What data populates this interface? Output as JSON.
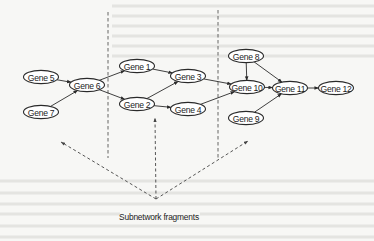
{
  "diagram": {
    "type": "gene-regulatory-network",
    "nodes": [
      {
        "id": "g5",
        "label": "Gene 5",
        "cx": 41,
        "cy": 77
      },
      {
        "id": "g7",
        "label": "Gene 7",
        "cx": 41,
        "cy": 112
      },
      {
        "id": "g6",
        "label": "Gene 6",
        "cx": 87,
        "cy": 85
      },
      {
        "id": "g1",
        "label": "Gene 1",
        "cx": 137,
        "cy": 66
      },
      {
        "id": "g2",
        "label": "Gene 2",
        "cx": 137,
        "cy": 104
      },
      {
        "id": "g3",
        "label": "Gene 3",
        "cx": 188,
        "cy": 76
      },
      {
        "id": "g4",
        "label": "Gene 4",
        "cx": 188,
        "cy": 109
      },
      {
        "id": "g8",
        "label": "Gene 8",
        "cx": 246,
        "cy": 56
      },
      {
        "id": "g10",
        "label": "Gene 10",
        "cx": 247,
        "cy": 87
      },
      {
        "id": "g9",
        "label": "Gene 9",
        "cx": 246,
        "cy": 118
      },
      {
        "id": "g11",
        "label": "Gene 11",
        "cx": 290,
        "cy": 88
      },
      {
        "id": "g12",
        "label": "Gene 12",
        "cx": 336,
        "cy": 88
      }
    ],
    "edges": [
      {
        "from": "g5",
        "to": "g6"
      },
      {
        "from": "g7",
        "to": "g6"
      },
      {
        "from": "g6",
        "to": "g1"
      },
      {
        "from": "g6",
        "to": "g2"
      },
      {
        "from": "g1",
        "to": "g3"
      },
      {
        "from": "g2",
        "to": "g3"
      },
      {
        "from": "g2",
        "to": "g4"
      },
      {
        "from": "g3",
        "to": "g10"
      },
      {
        "from": "g4",
        "to": "g10"
      },
      {
        "from": "g8",
        "to": "g10"
      },
      {
        "from": "g8",
        "to": "g11"
      },
      {
        "from": "g10",
        "to": "g11"
      },
      {
        "from": "g9",
        "to": "g11"
      },
      {
        "from": "g11",
        "to": "g12"
      }
    ],
    "dividers": [
      {
        "x": 108,
        "y1": 12,
        "y2": 158
      },
      {
        "x": 218,
        "y1": 10,
        "y2": 158
      }
    ],
    "annotation": {
      "label": "Subnetwork fragments",
      "origin": {
        "x": 156,
        "y": 199
      },
      "targets": [
        {
          "x": 61,
          "y": 142
        },
        {
          "x": 155,
          "y": 118
        },
        {
          "x": 248,
          "y": 141
        }
      ]
    }
  },
  "colors": {
    "background": "#f7f7f5",
    "stroke": "#2a2a2a",
    "text": "#1c1c1c"
  }
}
